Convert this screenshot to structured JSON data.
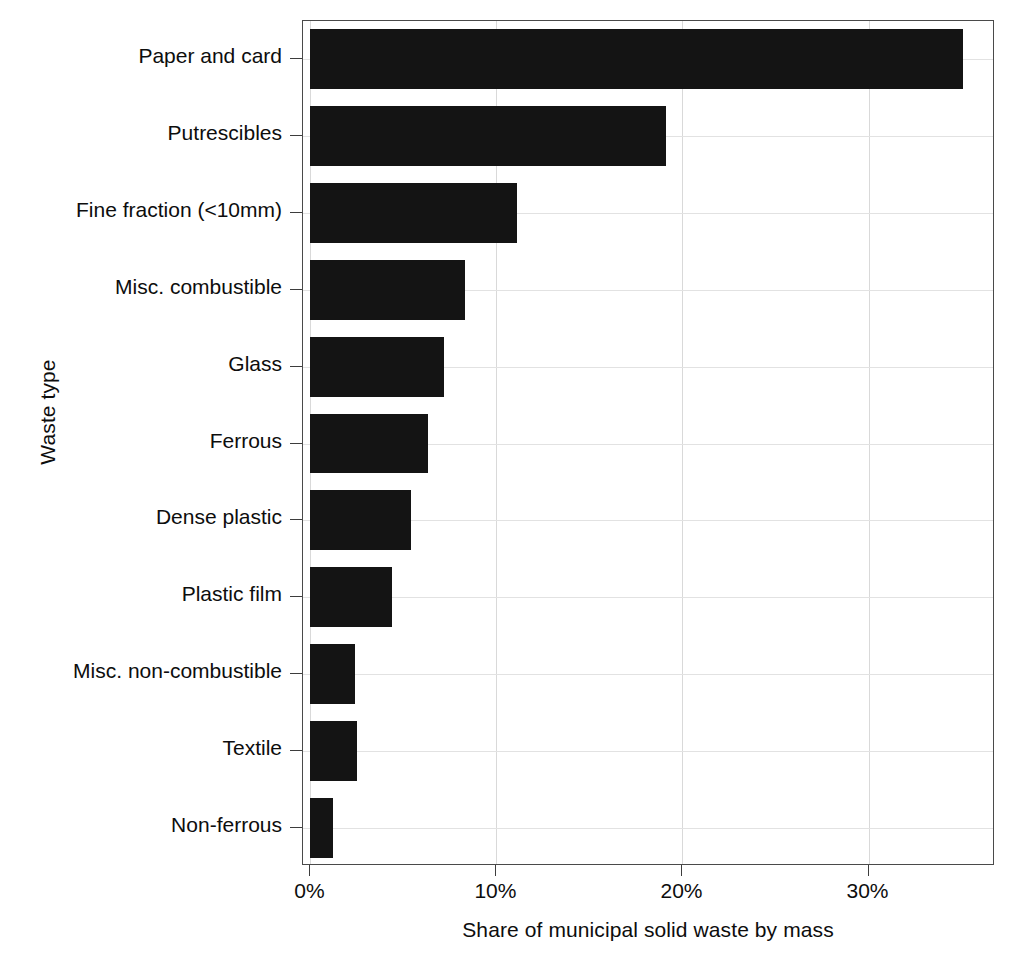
{
  "chart_data": {
    "type": "bar",
    "orientation": "horizontal",
    "title": "",
    "xlabel": "Share of municipal solid waste by mass",
    "ylabel": "Waste type",
    "categories": [
      "Non-ferrous",
      "Textile",
      "Misc. non-combustible",
      "Plastic film",
      "Dense plastic",
      "Ferrous",
      "Glass",
      "Misc. combustible",
      "Fine fraction (<10mm)",
      "Putrescibles",
      "Paper and card"
    ],
    "values": [
      1.2,
      2.5,
      2.4,
      4.4,
      5.4,
      6.3,
      7.2,
      8.3,
      11.1,
      19.1,
      35.1
    ],
    "value_unit": "%",
    "xlim": [
      -0.4,
      36.8
    ],
    "xticks": [
      0,
      10,
      20,
      30
    ],
    "xticklabels": [
      "0%",
      "10%",
      "20%",
      "30%"
    ],
    "grid": true,
    "grid_axis": "both",
    "legend": "none",
    "bar_color": "#141414",
    "grid_color": "#d9d9d9",
    "panel_border_color": "#4a4a4a"
  }
}
